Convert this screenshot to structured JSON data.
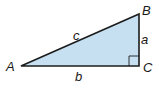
{
  "diagram": {
    "type": "right-triangle",
    "colors": {
      "fill": "#c6e0f2",
      "stroke": "#1c1c1c"
    },
    "vertices": [
      {
        "label": "A",
        "x": 21,
        "y": 66
      },
      {
        "label": "B",
        "x": 139,
        "y": 14
      },
      {
        "label": "C",
        "x": 139,
        "y": 66
      }
    ],
    "sides": [
      {
        "label": "c",
        "between": "A-B"
      },
      {
        "label": "a",
        "between": "B-C"
      },
      {
        "label": "b",
        "between": "A-C"
      }
    ],
    "right_angle_at": "C"
  }
}
